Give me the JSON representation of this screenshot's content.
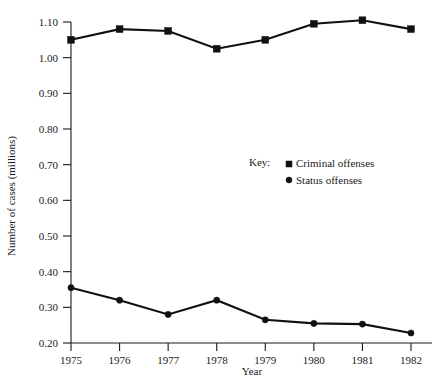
{
  "chart_data": {
    "type": "line",
    "title": "",
    "xlabel": "Year",
    "ylabel": "Number of cases (millions)",
    "categories": [
      "1975",
      "1976",
      "1977",
      "1978",
      "1979",
      "1980",
      "1981",
      "1982"
    ],
    "x": [
      1975,
      1976,
      1977,
      1978,
      1979,
      1980,
      1981,
      1982
    ],
    "xlim": [
      1975,
      1982
    ],
    "ylim": [
      0.2,
      1.1
    ],
    "ytick_labels": [
      "1.10",
      "1.00",
      "0.90",
      "0.80",
      "0.70",
      "0.60",
      "0.50",
      "0.40",
      "0.30",
      "0.20"
    ],
    "ytick_values": [
      1.1,
      1.0,
      0.9,
      0.8,
      0.7,
      0.6,
      0.5,
      0.4,
      0.3,
      0.2
    ],
    "grid": false,
    "legend_position": "center-right",
    "legend_title": "Key:",
    "series": [
      {
        "name": "Criminal offenses",
        "marker": "square",
        "values": [
          1.05,
          1.08,
          1.075,
          1.025,
          1.05,
          1.095,
          1.105,
          1.08
        ]
      },
      {
        "name": "Status offenses",
        "marker": "circle",
        "values": [
          0.355,
          0.32,
          0.28,
          0.32,
          0.265,
          0.255,
          0.253,
          0.228
        ]
      }
    ],
    "colors": {
      "axis": "#1a1a1a",
      "series_criminal": "#111111",
      "series_status": "#111111",
      "background": "#ffffff"
    }
  }
}
